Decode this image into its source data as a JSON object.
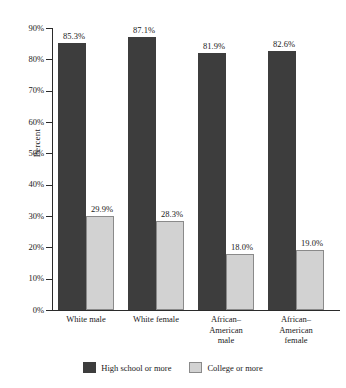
{
  "chart_data": {
    "type": "bar",
    "title": "",
    "xlabel": "",
    "ylabel": "Percent",
    "ylim": [
      0,
      90
    ],
    "ytick_step": 10,
    "grid": false,
    "legend_position": "bottom",
    "categories": [
      "White male",
      "White female",
      "African–American male",
      "African–American female"
    ],
    "category_lines": [
      [
        "White male"
      ],
      [
        "White female"
      ],
      [
        "African–",
        "American",
        "male"
      ],
      [
        "African–",
        "American",
        "female"
      ]
    ],
    "ytick_labels": [
      "90%",
      "80%",
      "70%",
      "60%",
      "50%",
      "40%",
      "30%",
      "20%",
      "10%",
      "0%"
    ],
    "ytick_values": [
      90,
      80,
      70,
      60,
      50,
      40,
      30,
      20,
      10,
      0
    ],
    "series": [
      {
        "name": "High school or more",
        "color": "#3d3d3d",
        "values": [
          85.3,
          87.1,
          81.9,
          82.6
        ],
        "labels": [
          "85.3%",
          "87.1%",
          "81.9%",
          "82.6%"
        ]
      },
      {
        "name": "College or more",
        "color": "#d2d2d2",
        "values": [
          29.9,
          28.3,
          18.0,
          19.0
        ],
        "labels": [
          "29.9%",
          "28.3%",
          "18.0%",
          "19.0%"
        ]
      }
    ]
  },
  "axis": {
    "y_title": "Percent"
  },
  "legend": {
    "items": [
      {
        "label": "High school or more"
      },
      {
        "label": "College or more"
      }
    ]
  }
}
